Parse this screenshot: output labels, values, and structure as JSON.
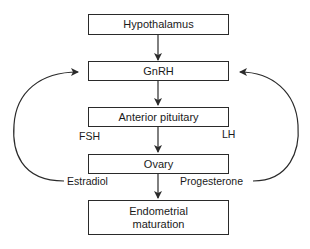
{
  "nodes": {
    "hypothalamus": "Hypothalamus",
    "gnrh": "GnRH",
    "anterior_pituitary": "Anterior pituitary",
    "ovary": "Ovary",
    "endometrial_line1": "Endometrial",
    "endometrial_line2": "maturation"
  },
  "edge_labels": {
    "fsh": "FSH",
    "lh": "LH",
    "estradiol": "Estradiol",
    "progesterone": "Progesterone"
  },
  "colors": {
    "stroke": "#2a2a2a",
    "background": "#ffffff"
  }
}
